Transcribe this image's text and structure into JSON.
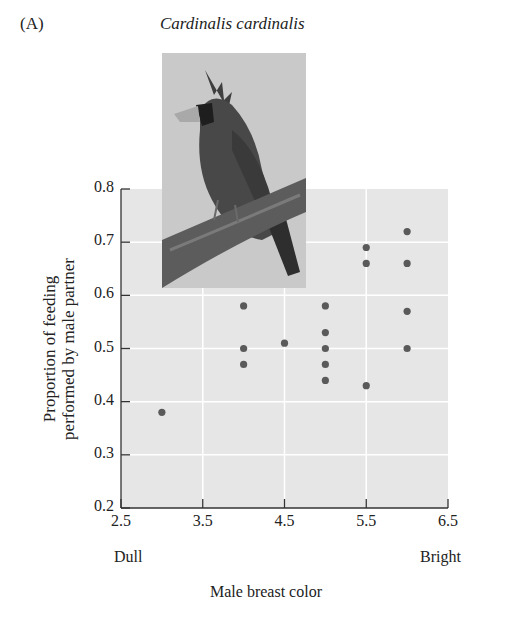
{
  "panel_label": "(A)",
  "species": "Cardinalis cardinalis",
  "photo": {
    "subject": "male northern cardinal perched on branch",
    "icon": "bird-photo"
  },
  "colors": {
    "plot_bg": "#e6e6e6",
    "grid": "#ffffff",
    "dot": "#5a5a5a",
    "axis": "#333333"
  },
  "chart_data": {
    "type": "scatter",
    "title": "Cardinalis cardinalis",
    "xlabel": "Male breast color",
    "ylabel": "Proportion of feeding performed by male partner",
    "x_end_labels": {
      "low": "Dull",
      "high": "Bright"
    },
    "xlim": [
      2.5,
      6.5
    ],
    "ylim": [
      0.2,
      0.8
    ],
    "xticks": [
      "2.5",
      "3.5",
      "4.5",
      "5.5",
      "6.5"
    ],
    "yticks": [
      "0.2",
      "0.3",
      "0.4",
      "0.5",
      "0.6",
      "0.7",
      "0.8"
    ],
    "grid": true,
    "points": [
      {
        "x": 3.0,
        "y": 0.38
      },
      {
        "x": 4.0,
        "y": 0.58
      },
      {
        "x": 4.0,
        "y": 0.5
      },
      {
        "x": 4.0,
        "y": 0.47
      },
      {
        "x": 4.5,
        "y": 0.51
      },
      {
        "x": 5.0,
        "y": 0.58
      },
      {
        "x": 5.0,
        "y": 0.53
      },
      {
        "x": 5.0,
        "y": 0.5
      },
      {
        "x": 5.0,
        "y": 0.47
      },
      {
        "x": 5.0,
        "y": 0.44
      },
      {
        "x": 5.5,
        "y": 0.69
      },
      {
        "x": 5.5,
        "y": 0.66
      },
      {
        "x": 5.5,
        "y": 0.43
      },
      {
        "x": 6.0,
        "y": 0.72
      },
      {
        "x": 6.0,
        "y": 0.66
      },
      {
        "x": 6.0,
        "y": 0.57
      },
      {
        "x": 6.0,
        "y": 0.5
      }
    ]
  }
}
